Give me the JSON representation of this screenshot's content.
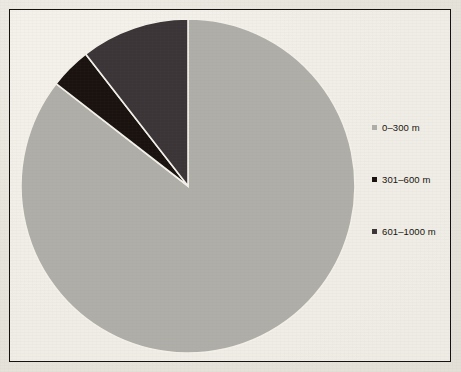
{
  "figure": {
    "background_color": "#e7e4dc",
    "frame_color": "#15110e"
  },
  "chart_data": {
    "type": "pie",
    "title": "",
    "categories": [
      "0–300 m",
      "301–600 m",
      "601–1000 m"
    ],
    "values": [
      85.5,
      4.0,
      10.5
    ],
    "units": "percent",
    "colors": [
      "#b0aea8",
      "#19120f",
      "#3b3537"
    ],
    "start_angle_deg": 90,
    "direction": "counterclockwise",
    "legend_position": "right",
    "grid": false,
    "slices": [
      {
        "label": "0–300 m",
        "value": 85.5,
        "color": "#b0aea8",
        "start_deg": 90.0,
        "end_deg": -217.8
      },
      {
        "label": "301–600 m",
        "value": 4.0,
        "color": "#19120f",
        "start_deg": 104.4,
        "end_deg": 90.0
      },
      {
        "label": "601–1000 m",
        "value": 10.5,
        "color": "#3b3537",
        "start_deg": 142.2,
        "end_deg": 104.4
      }
    ]
  },
  "legend": {
    "items": [
      {
        "label": "0–300 m",
        "marker": "square-marker",
        "color": "#b0aea8"
      },
      {
        "label": "301–600 m",
        "marker": "square-marker",
        "color": "#19120f"
      },
      {
        "label": "601–1000 m",
        "marker": "square-marker",
        "color": "#3b3537"
      }
    ]
  },
  "pie_geometry": {
    "center_x": 188,
    "center_y": 186,
    "radius": 167
  }
}
